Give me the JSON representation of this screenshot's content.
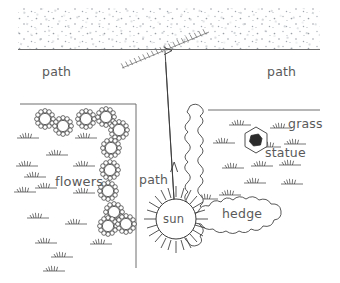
{
  "diagram": {
    "labels": {
      "path_left": "path",
      "path_right": "path",
      "path_center": "path",
      "flowers": "flowers",
      "grass": "grass",
      "statue": "statue",
      "hedge": "hedge",
      "sun": "sun"
    },
    "colors": {
      "ink": "#3a3a3a",
      "line": "#6e6e6e",
      "text": "#5a5a5a",
      "stipple": "#9aa0a6",
      "statue_fill": "#2b2b2b",
      "background": "#ffffff"
    },
    "elements": [
      {
        "name": "gravel-stipple-band",
        "kind": "texture",
        "region": "top"
      },
      {
        "name": "path-boundary-line",
        "kind": "line"
      },
      {
        "name": "gate-hatched",
        "kind": "hatched-line"
      },
      {
        "name": "flower-bed-boundary",
        "kind": "line"
      },
      {
        "name": "grass-bed-boundary",
        "kind": "line"
      },
      {
        "name": "flower-cluster",
        "kind": "symbol",
        "count": 11
      },
      {
        "name": "grass-tuft",
        "kind": "symbol",
        "count": 28
      },
      {
        "name": "hedge-vertical",
        "kind": "shape"
      },
      {
        "name": "hedge-horizontal",
        "kind": "shape"
      },
      {
        "name": "statue-hexagon",
        "kind": "shape"
      },
      {
        "name": "sun-symbol",
        "kind": "shape"
      },
      {
        "name": "path-arrow",
        "kind": "arrow",
        "direction": "up"
      }
    ]
  }
}
